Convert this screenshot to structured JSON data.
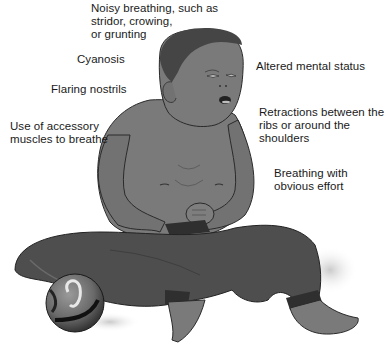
{
  "figure": {
    "colors": {
      "background": "#ffffff",
      "skin": "#7a7a7a",
      "skin_shadow": "#5e5e5e",
      "hair": "#454545",
      "pants": "#4e4e4e",
      "pants_dark": "#333333",
      "outline": "#2a2a2a",
      "text": "#1a1a1a"
    }
  },
  "labels": {
    "noisy_breathing": "Noisy breathing, such as\nstridor, crowing,\nor grunting",
    "cyanosis": "Cyanosis",
    "flaring_nostrils": "Flaring nostrils",
    "accessory_muscles": "Use of accessory\nmuscles to breathe",
    "altered_mental_status": "Altered mental status",
    "retractions": "Retractions between the\nribs or around the\nshoulders",
    "breathing_effort": "Breathing with\nobvious effort"
  }
}
